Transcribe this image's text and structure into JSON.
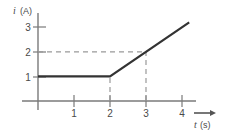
{
  "chart_data": {
    "type": "line",
    "title": "",
    "xlabel": "t (s)",
    "ylabel": "i (A)",
    "xlabel_var": "t",
    "xlabel_unit": "(s)",
    "ylabel_var": "i",
    "ylabel_unit": "(A)",
    "xlim": [
      0,
      4.6
    ],
    "ylim": [
      0,
      3.5
    ],
    "xticks": [
      1,
      2,
      3,
      4
    ],
    "xtick_labels": [
      "1",
      "2",
      "3",
      "4"
    ],
    "yticks": [
      1,
      2,
      3
    ],
    "ytick_labels": [
      "1",
      "2",
      "3"
    ],
    "grid": false,
    "legend": null,
    "series": [
      {
        "name": "i(t)",
        "points": [
          {
            "x": 0,
            "y": 1
          },
          {
            "x": 2,
            "y": 1
          },
          {
            "x": 4.2,
            "y": 3.2
          }
        ],
        "color": "#333333",
        "width": 2.2
      }
    ],
    "guide_lines": [
      {
        "name": "horizontal-guide-i2",
        "orientation": "horizontal",
        "value": 2,
        "from": 0,
        "to": 3,
        "style": "dashed"
      },
      {
        "name": "vertical-guide-t2",
        "orientation": "vertical",
        "value": 2,
        "from": 0,
        "to": 1,
        "style": "dashed"
      },
      {
        "name": "vertical-guide-t3",
        "orientation": "vertical",
        "value": 3,
        "from": 0,
        "to": 2,
        "style": "dashed"
      }
    ],
    "guide_color": "#999999",
    "axis_color": "#7a7a7a",
    "background": "#ffffff",
    "annotations": []
  },
  "axis": {
    "x_arrow": "arrow-right-icon",
    "x_axis_name": "time-axis",
    "y_axis_name": "current-axis"
  }
}
